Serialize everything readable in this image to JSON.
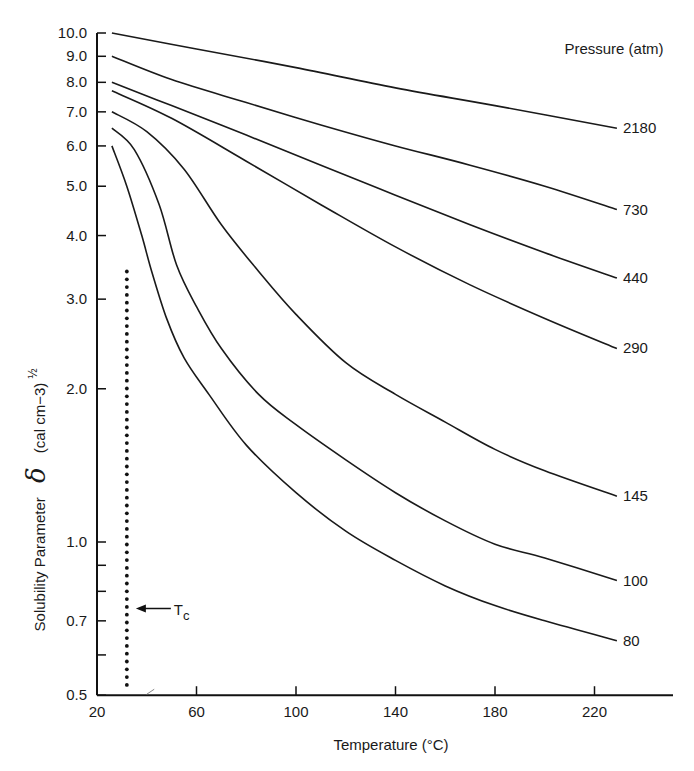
{
  "chart_data": {
    "type": "line",
    "title": "",
    "xlabel": "Temperature (°C)",
    "ylabel": "Solubility Parameter δ (cal cm−3)½",
    "ylabel_parts": {
      "text": "Solubility Parameter",
      "symbol": "δ",
      "units": "(cal cm−3)",
      "exponent": "½"
    },
    "legend_title": "Pressure (atm)",
    "legend_position": "right, curve-end labels",
    "yscale": "log",
    "xlim": [
      20,
      240
    ],
    "ylim": [
      0.5,
      10.0
    ],
    "grid": false,
    "x_ticks": [
      20,
      60,
      100,
      140,
      180,
      220
    ],
    "x_tick_labels": [
      "20",
      "60",
      "100",
      "140",
      "180",
      "220"
    ],
    "y_ticks": [
      0.5,
      0.6,
      0.7,
      0.8,
      0.9,
      1.0,
      2.0,
      3.0,
      4.0,
      5.0,
      6.0,
      7.0,
      8.0,
      9.0,
      10.0
    ],
    "y_tick_labels": [
      {
        "value": 0.5,
        "label": "0.5"
      },
      {
        "value": 0.7,
        "label": "0.7"
      },
      {
        "value": 1.0,
        "label": "1.0"
      },
      {
        "value": 2.0,
        "label": "2.0"
      },
      {
        "value": 3.0,
        "label": "3.0"
      },
      {
        "value": 4.0,
        "label": "4.0"
      },
      {
        "value": 5.0,
        "label": "5.0"
      },
      {
        "value": 6.0,
        "label": "6.0"
      },
      {
        "value": 7.0,
        "label": "7.0"
      },
      {
        "value": 8.0,
        "label": "8.0"
      },
      {
        "value": 9.0,
        "label": "9.0"
      },
      {
        "value": 10.0,
        "label": "10.0"
      }
    ],
    "series": [
      {
        "name": "2180",
        "x": [
          26,
          60,
          100,
          140,
          180,
          229
        ],
        "values": [
          10.0,
          9.3,
          8.55,
          7.8,
          7.2,
          6.5
        ]
      },
      {
        "name": "730",
        "x": [
          26,
          50,
          80,
          110,
          140,
          170,
          200,
          229
        ],
        "values": [
          9.0,
          8.1,
          7.3,
          6.6,
          6.0,
          5.5,
          5.0,
          4.5
        ]
      },
      {
        "name": "440",
        "x": [
          26,
          50,
          80,
          110,
          140,
          170,
          200,
          229
        ],
        "values": [
          8.0,
          7.2,
          6.3,
          5.5,
          4.8,
          4.2,
          3.7,
          3.3
        ]
      },
      {
        "name": "290",
        "x": [
          26,
          50,
          80,
          110,
          140,
          170,
          200,
          229
        ],
        "values": [
          7.7,
          6.8,
          5.6,
          4.6,
          3.8,
          3.2,
          2.75,
          2.4
        ]
      },
      {
        "name": "145",
        "x": [
          26,
          40,
          55,
          70,
          85,
          100,
          120,
          140,
          160,
          180,
          200,
          229
        ],
        "values": [
          7.0,
          6.4,
          5.4,
          4.2,
          3.4,
          2.8,
          2.25,
          1.95,
          1.72,
          1.52,
          1.38,
          1.23
        ]
      },
      {
        "name": "100",
        "x": [
          26,
          35,
          45,
          52,
          60,
          70,
          85,
          100,
          120,
          140,
          160,
          180,
          200,
          229
        ],
        "values": [
          6.5,
          5.9,
          4.6,
          3.5,
          2.9,
          2.4,
          1.95,
          1.7,
          1.45,
          1.25,
          1.1,
          0.99,
          0.93,
          0.84
        ]
      },
      {
        "name": "80",
        "x": [
          26,
          32,
          38,
          42,
          48,
          55,
          65,
          80,
          100,
          120,
          140,
          160,
          180,
          200,
          229
        ],
        "values": [
          6.0,
          5.0,
          4.0,
          3.4,
          2.75,
          2.3,
          1.95,
          1.55,
          1.25,
          1.05,
          0.92,
          0.82,
          0.75,
          0.7,
          0.64
        ]
      }
    ],
    "annotations": [
      {
        "type": "vertical-dotted-line",
        "x": 32,
        "y_range": [
          0.51,
          3.4
        ],
        "label": "Tc"
      },
      {
        "type": "arrow",
        "text": "Tc",
        "points_to_x": 32,
        "at_y": 0.74
      }
    ]
  }
}
